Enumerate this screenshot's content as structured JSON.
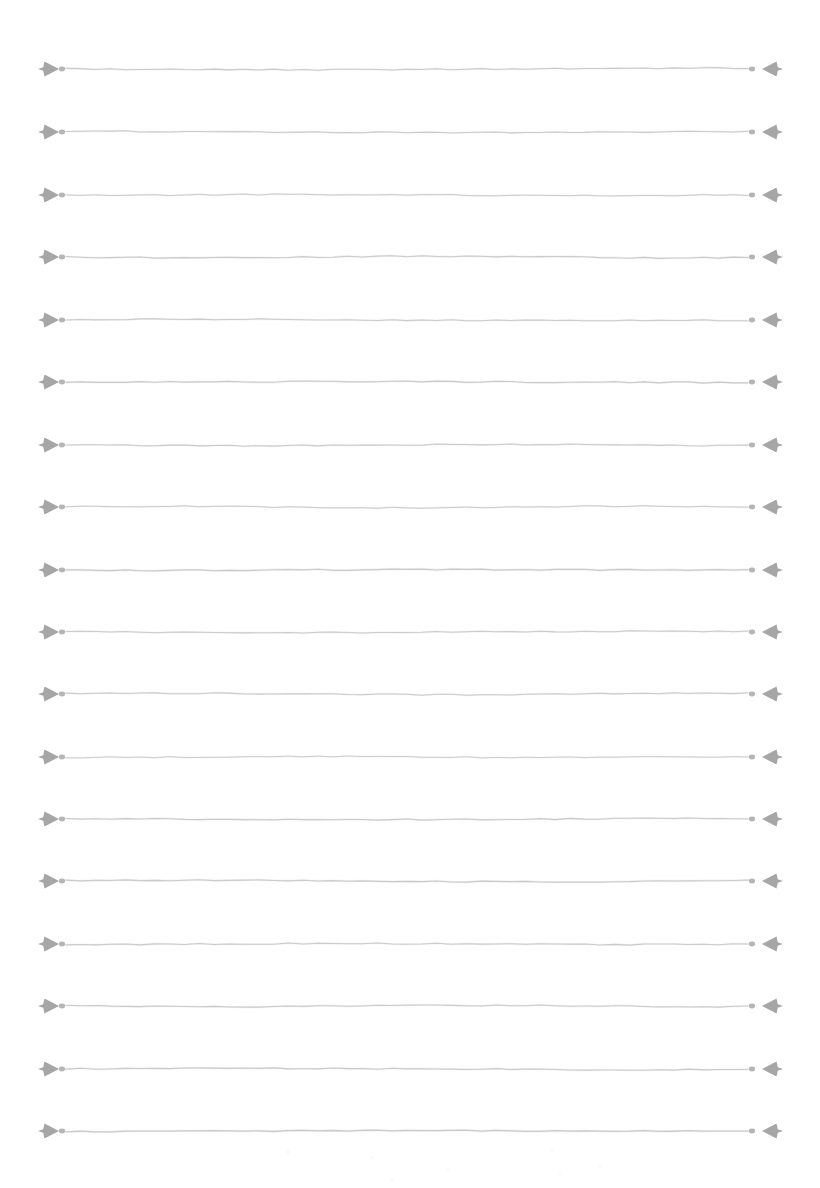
{
  "document": {
    "type": "blank-lined-page",
    "title": "Blank ruled writing page",
    "page_width": 820,
    "page_height": 1188,
    "background_color": "#ffffff",
    "text_content": "",
    "has_text": false
  },
  "rule": {
    "count": 18,
    "first_y": 69,
    "spacing": 62.5,
    "line_color": "#c9c9c9",
    "ornament_color": "#9a9a9a",
    "dot_color": "#a8a8a8",
    "left_ornament_x": 40,
    "left_dot_x": 62,
    "line_start_x": 66,
    "line_end_x": 748,
    "right_dot_x": 752,
    "right_ornament_x": 758,
    "right_ornament_end_x": 781,
    "ornament_name": "four-pointed-dart-star",
    "style": "hand-drawn"
  },
  "rows": [
    {
      "index": 1,
      "y": 69,
      "label": "ruled-line-1",
      "line_weight": 1.0,
      "wave": 0.9
    },
    {
      "index": 2,
      "y": 132,
      "label": "ruled-line-2",
      "line_weight": 1.0,
      "wave": -0.7
    },
    {
      "index": 3,
      "y": 195,
      "label": "ruled-line-3",
      "line_weight": 0.95,
      "wave": 0.6
    },
    {
      "index": 4,
      "y": 257,
      "label": "ruled-line-4",
      "line_weight": 1.05,
      "wave": -1.0
    },
    {
      "index": 5,
      "y": 320,
      "label": "ruled-line-5",
      "line_weight": 1.0,
      "wave": 0.8
    },
    {
      "index": 6,
      "y": 382,
      "label": "ruled-line-6",
      "line_weight": 1.1,
      "wave": -0.5
    },
    {
      "index": 7,
      "y": 445,
      "label": "ruled-line-7",
      "line_weight": 1.0,
      "wave": 0.7
    },
    {
      "index": 8,
      "y": 507,
      "label": "ruled-line-8",
      "line_weight": 0.95,
      "wave": -0.9
    },
    {
      "index": 9,
      "y": 570,
      "label": "ruled-line-9",
      "line_weight": 1.15,
      "wave": 0.5
    },
    {
      "index": 10,
      "y": 632,
      "label": "ruled-line-10",
      "line_weight": 1.0,
      "wave": -0.8
    },
    {
      "index": 11,
      "y": 694,
      "label": "ruled-line-11",
      "line_weight": 1.0,
      "wave": 0.9
    },
    {
      "index": 12,
      "y": 757,
      "label": "ruled-line-12",
      "line_weight": 0.9,
      "wave": -0.6
    },
    {
      "index": 13,
      "y": 819,
      "label": "ruled-line-13",
      "line_weight": 1.05,
      "wave": 0.7
    },
    {
      "index": 14,
      "y": 881,
      "label": "ruled-line-14",
      "line_weight": 1.1,
      "wave": -1.0
    },
    {
      "index": 15,
      "y": 944,
      "label": "ruled-line-15",
      "line_weight": 1.0,
      "wave": 0.6
    },
    {
      "index": 16,
      "y": 1006,
      "label": "ruled-line-16",
      "line_weight": 1.0,
      "wave": -0.7
    },
    {
      "index": 17,
      "y": 1069,
      "label": "ruled-line-17",
      "line_weight": 1.05,
      "wave": 0.8
    },
    {
      "index": 18,
      "y": 1131,
      "label": "ruled-line-18",
      "line_weight": 1.2,
      "wave": -0.5
    }
  ]
}
